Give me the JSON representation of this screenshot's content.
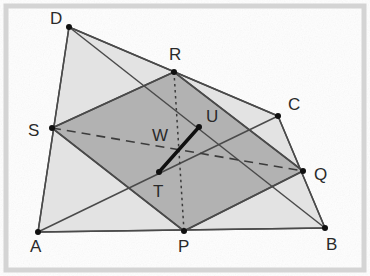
{
  "figure": {
    "canvas": {
      "width": 370,
      "height": 276
    },
    "colors": {
      "outer_fill": "#e3e3e3",
      "inner_fill": "#b2b2b2",
      "stroke": "#4a4a4a",
      "bold_stroke": "#101010",
      "frame": "#d4d4d4",
      "background": "#fefefe",
      "label": "#2a2a2a"
    },
    "frame": {
      "x": 6,
      "y": 6,
      "width": 358,
      "height": 264
    },
    "points": {
      "A": {
        "x": 38,
        "y": 232,
        "label": "A",
        "label_x": 30,
        "label_y": 252,
        "dot": true
      },
      "B": {
        "x": 325,
        "y": 228,
        "label": "B",
        "label_x": 326,
        "label_y": 250,
        "dot": true
      },
      "C": {
        "x": 278,
        "y": 116,
        "label": "C",
        "label_x": 288,
        "label_y": 110,
        "dot": true
      },
      "D": {
        "x": 69,
        "y": 27,
        "label": "D",
        "label_x": 50,
        "label_y": 24,
        "dot": true
      },
      "P": {
        "x": 184,
        "y": 231,
        "label": "P",
        "label_x": 178,
        "label_y": 252,
        "dot": true
      },
      "Q": {
        "x": 303,
        "y": 171,
        "label": "Q",
        "label_x": 314,
        "label_y": 180,
        "dot": true
      },
      "R": {
        "x": 174,
        "y": 72,
        "label": "R",
        "label_x": 169,
        "label_y": 60,
        "dot": true
      },
      "S": {
        "x": 52,
        "y": 128,
        "label": "S",
        "label_x": 28,
        "label_y": 136,
        "dot": true
      },
      "T": {
        "x": 159,
        "y": 172,
        "label": "T",
        "label_x": 153,
        "label_y": 197,
        "dot": true
      },
      "U": {
        "x": 199,
        "y": 127,
        "label": "U",
        "label_x": 206,
        "label_y": 122,
        "dot": true
      },
      "W": {
        "x": 180,
        "y": 150,
        "label": "W",
        "label_x": 152,
        "label_y": 141,
        "dot": false
      }
    },
    "polygons": {
      "outer_quad": {
        "name": "ABCD",
        "points": "38,232 325,228 278,116 69,27"
      },
      "inner_quad": {
        "name": "PQRS",
        "points": "184,231 303,171 174,72 52,128"
      }
    },
    "segments": [
      {
        "name": "AB",
        "style": "plain",
        "x1": 38,
        "y1": 232,
        "x2": 325,
        "y2": 228
      },
      {
        "name": "BC",
        "style": "plain",
        "x1": 325,
        "y1": 228,
        "x2": 278,
        "y2": 116
      },
      {
        "name": "CD",
        "style": "plain",
        "x1": 278,
        "y1": 116,
        "x2": 69,
        "y2": 27
      },
      {
        "name": "DA",
        "style": "plain",
        "x1": 69,
        "y1": 27,
        "x2": 38,
        "y2": 232
      },
      {
        "name": "AC",
        "style": "plain",
        "x1": 38,
        "y1": 232,
        "x2": 278,
        "y2": 116
      },
      {
        "name": "BD",
        "style": "plain",
        "x1": 325,
        "y1": 228,
        "x2": 69,
        "y2": 27
      },
      {
        "name": "PQ",
        "style": "plain",
        "x1": 184,
        "y1": 231,
        "x2": 303,
        "y2": 171
      },
      {
        "name": "QR",
        "style": "plain",
        "x1": 303,
        "y1": 171,
        "x2": 174,
        "y2": 72
      },
      {
        "name": "RS",
        "style": "plain",
        "x1": 174,
        "y1": 72,
        "x2": 52,
        "y2": 128
      },
      {
        "name": "SP",
        "style": "plain",
        "x1": 52,
        "y1": 128,
        "x2": 184,
        "y2": 231
      },
      {
        "name": "SQ",
        "style": "dashed",
        "x1": 52,
        "y1": 128,
        "x2": 303,
        "y2": 171
      },
      {
        "name": "RP",
        "style": "dotted",
        "x1": 174,
        "y1": 72,
        "x2": 184,
        "y2": 231
      },
      {
        "name": "TU",
        "style": "bold",
        "x1": 159,
        "y1": 172,
        "x2": 199,
        "y2": 127
      }
    ]
  }
}
